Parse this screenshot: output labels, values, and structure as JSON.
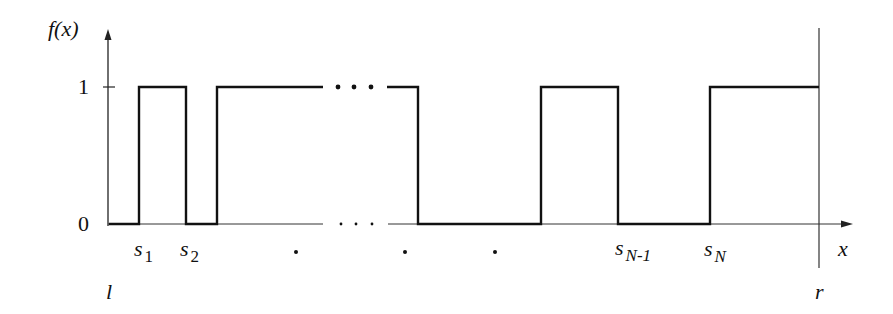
{
  "figure": {
    "y_axis_label": "f(x)",
    "x_axis_label": "x",
    "y_ticks": [
      "1",
      "0"
    ],
    "left_bound_label": "l",
    "right_bound_label": "r",
    "switch_points": [
      {
        "base": "s",
        "sub": "1"
      },
      {
        "base": "s",
        "sub": "2"
      },
      {
        "base": "s",
        "sub": "N-1"
      },
      {
        "base": "s",
        "sub": "N"
      }
    ],
    "ellipsis_top": "• • •",
    "ellipsis_bottom": ". . .",
    "dot_markers": [
      "•",
      "•",
      "•"
    ]
  },
  "colors": {
    "ink": "#111111",
    "background": "#ffffff"
  }
}
